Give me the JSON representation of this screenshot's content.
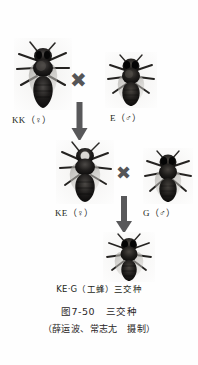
{
  "figure": {
    "caption_main": "图7-50　三交种",
    "caption_credit": "（薛运波、常志尢　摄制）"
  },
  "generation1": {
    "parent_female": {
      "label": "KK（♀）",
      "icon": "honeybee-queen-photo"
    },
    "cross_symbol": "✖",
    "parent_male": {
      "label": "E（♂）",
      "icon": "honeybee-drone-photo"
    },
    "arrow_symbol": "downward-arrow"
  },
  "generation2": {
    "hybrid_female": {
      "label": "KE（♀）",
      "icon": "honeybee-queen-photo"
    },
    "cross_symbol": "✖",
    "parent_male": {
      "label": "G（♂）",
      "icon": "honeybee-drone-photo"
    },
    "arrow_symbol": "downward-arrow"
  },
  "generation3": {
    "offspring": {
      "label": "KE·G（工蜂）三交种",
      "icon": "honeybee-worker-photo"
    }
  },
  "colors": {
    "symbol_gray": "#555557",
    "text_black": "#231f20",
    "background": "#fefefe"
  }
}
